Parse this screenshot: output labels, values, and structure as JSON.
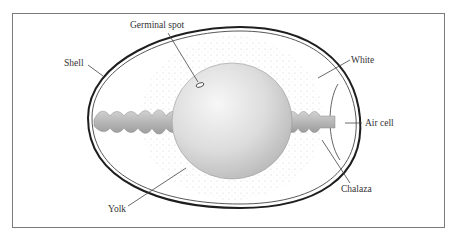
{
  "diagram": {
    "labels": {
      "germinal_spot": "Germinal spot",
      "shell": "Shell",
      "white": "White",
      "air_cell": "Air cell",
      "chalaza": "Chalaza",
      "yolk": "Yolk"
    }
  },
  "colors": {
    "frame": "#7a7a7a",
    "shell": "#222222",
    "yolk_light": "#f4f4f4",
    "yolk_dark": "#b8b8b8",
    "chalaza": "#b0b0b0",
    "label_text": "#333333",
    "leader_line": "#444444"
  }
}
